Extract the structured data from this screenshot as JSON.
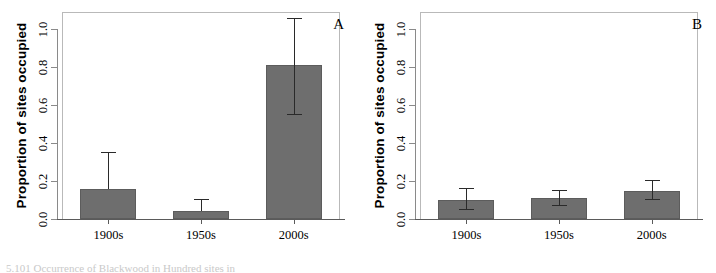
{
  "figure": {
    "caption_fragment": "5.101   Occurrence  of Blackwood  in  Hundred  sites  in",
    "panels": [
      {
        "letter": "A",
        "ylabel": "Proportion of sites occupied",
        "yticks": [
          "0.0",
          "0.2",
          "0.4",
          "0.6",
          "0.8",
          "1.0"
        ],
        "xticks": [
          "1900s",
          "1950s",
          "2000s"
        ]
      },
      {
        "letter": "B",
        "ylabel": "Proportion of sites occupied",
        "yticks": [
          "0.0",
          "0.2",
          "0.4",
          "0.6",
          "0.8",
          "1.0"
        ],
        "xticks": [
          "1900s",
          "1950s",
          "2000s"
        ]
      }
    ],
    "colors": {
      "bar_fill": "#6e6e6e",
      "bar_edge": "#5c5c5c",
      "error_bar": "#2a2a2a",
      "axis": "#5a5a5a",
      "box_border": "#b9b9b9",
      "text": "#000000"
    }
  },
  "chart_data": [
    {
      "type": "bar",
      "panel": "A",
      "title": "",
      "xlabel": "",
      "ylabel": "Proportion of sites occupied",
      "categories": [
        "1900s",
        "1950s",
        "2000s"
      ],
      "values": [
        0.16,
        0.04,
        0.81
      ],
      "error_low": [
        0.16,
        0.04,
        0.55
      ],
      "error_high": [
        0.35,
        0.1,
        1.06
      ],
      "ylim": [
        0.0,
        1.0
      ],
      "yticks": [
        0.0,
        0.2,
        0.4,
        0.6,
        0.8,
        1.0
      ],
      "grid": false,
      "legend": "none"
    },
    {
      "type": "bar",
      "panel": "B",
      "title": "",
      "xlabel": "",
      "ylabel": "Proportion of sites occupied",
      "categories": [
        "1900s",
        "1950s",
        "2000s"
      ],
      "values": [
        0.1,
        0.11,
        0.15
      ],
      "error_low": [
        0.045,
        0.07,
        0.1
      ],
      "error_high": [
        0.16,
        0.15,
        0.2
      ],
      "ylim": [
        0.0,
        1.0
      ],
      "yticks": [
        0.0,
        0.2,
        0.4,
        0.6,
        0.8,
        1.0
      ],
      "grid": false,
      "legend": "none"
    }
  ]
}
